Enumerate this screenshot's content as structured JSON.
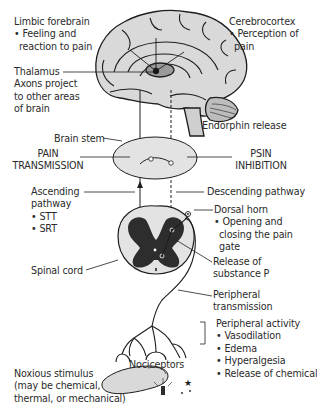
{
  "diagram": {
    "type": "pain-pathway",
    "colors": {
      "brain_fill": "#d9d9d9",
      "brain_stroke": "#1e1e1e",
      "thalamus_fill": "#9a9a9a",
      "brainstem_ellipse_fill": "#e3e3e3",
      "gray_matter": "#2d2d2d",
      "background": "#ffffff"
    },
    "labels": {
      "limbic": {
        "title": "Limbic forebrain",
        "bullets": [
          "Feeling and",
          "reaction to pain"
        ]
      },
      "cerebrocortex": {
        "title": "Cerebrocortex",
        "bullets": [
          "Perception of",
          "pain"
        ]
      },
      "thalamus": {
        "title": "Thalamus",
        "lines": [
          "Axons project",
          "to other areas",
          "of brain"
        ]
      },
      "endorphin": "Endorphin release",
      "brain_stem": "Brain stem",
      "pain_transmission": [
        "PAIN",
        "TRANSMISSION"
      ],
      "psin_inhibition": [
        "PSIN",
        "INHIBITION"
      ],
      "ascending": {
        "title": [
          "Ascending",
          "pathway"
        ],
        "bullets": [
          "STT",
          "SRT"
        ]
      },
      "descending": "Descending pathway",
      "dorsal_horn": {
        "title": "Dorsal horn",
        "bullets": [
          "Opening and",
          "closing the pain",
          "gate"
        ]
      },
      "spinal_cord": "Spinal cord",
      "substance_p": [
        "Release of",
        "substance P"
      ],
      "peripheral_transmission": [
        "Peripheral",
        "transmission"
      ],
      "peripheral_activity": {
        "title": "Peripheral activity",
        "bullets": [
          "Vasodilation",
          "Edema",
          "Hyperalgesia",
          "Release of chemicals"
        ]
      },
      "nociceptors": "Nociceptors",
      "noxious": [
        "Noxious stimulus",
        "(may be chemical,",
        "thermal, or mechanical)"
      ]
    },
    "bullet_glyph": "•"
  }
}
